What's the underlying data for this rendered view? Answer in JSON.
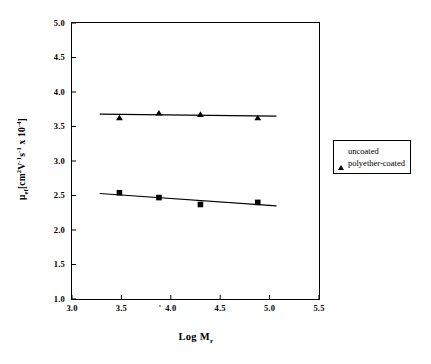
{
  "chart_data": {
    "type": "scatter",
    "title": "",
    "xlabel": "Log M",
    "xlabel_sub": "r",
    "ylabel_parts": {
      "mu": "μ",
      "mu_sub": "ef",
      "open": "[cm",
      "sup2": "2",
      "v": "V",
      "sup_m1a": "-1",
      "s": "s",
      "sup_m1b": "-1",
      "times": " x 10",
      "sup_m4": "-4",
      "close": "]"
    },
    "ylabel_plain": "μef[cm2V-1s-1 x 10-4]",
    "xlim": [
      3.0,
      5.5
    ],
    "ylim": [
      1.0,
      5.0
    ],
    "xticks": [
      "3.0",
      "3.5",
      "4.0",
      "4.5",
      "5.0",
      "5.5"
    ],
    "xtick_values": [
      3.0,
      3.5,
      4.0,
      4.5,
      5.0,
      5.5
    ],
    "yticks": [
      "5.0",
      "4.5",
      "4.0",
      "3.5",
      "3.0",
      "2.5",
      "2.0",
      "1.5",
      "1.0"
    ],
    "ytick_values": [
      5.0,
      4.5,
      4.0,
      3.5,
      3.0,
      2.5,
      2.0,
      1.5,
      1.0
    ],
    "grid": false,
    "legend_position": "right-outside",
    "series": [
      {
        "name": "uncoated",
        "marker": "triangle",
        "color": "#000000",
        "x": [
          3.48,
          3.88,
          4.3,
          4.88
        ],
        "y": [
          3.63,
          3.7,
          3.68,
          3.63
        ],
        "trendline": {
          "x": [
            3.28,
            5.07
          ],
          "y": [
            3.68,
            3.65
          ]
        }
      },
      {
        "name": "polyether-coated",
        "marker": "square",
        "color": "#000000",
        "x": [
          3.48,
          3.88,
          4.3,
          4.88
        ],
        "y": [
          2.54,
          2.47,
          2.37,
          2.4
        ],
        "trendline": {
          "x": [
            3.28,
            5.07
          ],
          "y": [
            2.53,
            2.35
          ]
        }
      }
    ]
  },
  "legend": {
    "items": [
      {
        "label": "uncoated",
        "marker": "triangle"
      },
      {
        "label": "polyether-coated",
        "marker": "square"
      }
    ]
  }
}
